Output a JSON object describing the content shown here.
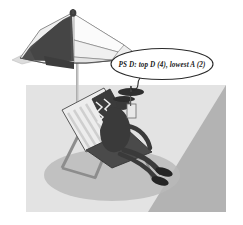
{
  "scene": {
    "title": "Beach chair cartoon illustration",
    "width": 243,
    "height": 225,
    "style": "grayscale cartoon clip-art"
  },
  "speech_bubble": {
    "text": "PS D: top D (4), lowest A (2)",
    "shape": "ellipse",
    "tail": "downward curl",
    "fill": "#ffffff",
    "stroke": "#2a2a2a"
  },
  "umbrella": {
    "label": "beach umbrella",
    "panels_dark_color": "#4a4a4a",
    "panels_light_color": "#f2f2f2",
    "pole_color": "#b8b8b8",
    "finial": "knob"
  },
  "chair": {
    "label": "striped deck chair",
    "stripe_light": "#ededed",
    "stripe_dark": "#3c3c3c",
    "frame_color": "#8a8a8a"
  },
  "figure": {
    "label": "person reclining",
    "body_color": "#3a3a3a"
  },
  "drink": {
    "label": "drink with parasol",
    "parasol_color": "#2f2f2f"
  },
  "ground": {
    "label": "beach ground panel",
    "fill": "#e3e3e3",
    "wedge_fill": "#b3b3b3",
    "shadow_fill": "#b9b9b9"
  },
  "colors": {
    "background": "#ffffff",
    "ink": "#2a2a2a",
    "mid_gray": "#9a9a9a",
    "dark_gray": "#4a4a4a",
    "light_gray": "#e3e3e3"
  }
}
